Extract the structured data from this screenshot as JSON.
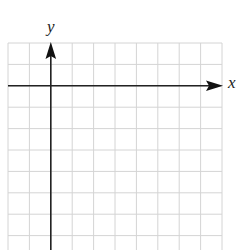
{
  "diagram": {
    "type": "coordinate-grid",
    "axes": {
      "x_label": "x",
      "y_label": "y"
    },
    "grid": {
      "columns": 10,
      "rows": 10,
      "origin_column_offset": 2,
      "origin_row_offset": 2
    },
    "colors": {
      "grid_line": "#d4d4d4",
      "axis": "#222222",
      "background": "#ffffff"
    }
  }
}
